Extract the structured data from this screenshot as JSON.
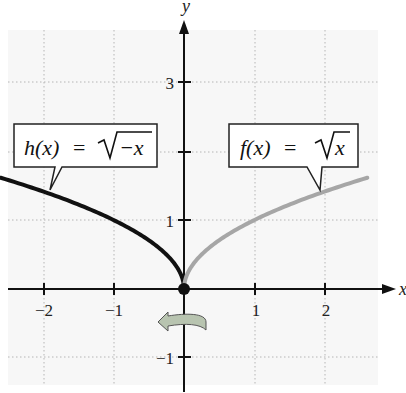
{
  "chart_data": {
    "type": "line",
    "title": "",
    "xlabel": "x",
    "ylabel": "y",
    "xlim": [
      -2.6,
      2.6
    ],
    "ylim": [
      -1.3,
      3.7
    ],
    "grid": true,
    "x_ticks": [
      -2,
      -1,
      1,
      2
    ],
    "x_tick_labels": [
      "−2",
      "−1",
      "1",
      "2"
    ],
    "y_ticks": [
      -1,
      1,
      2,
      3
    ],
    "y_tick_labels": [
      "−1",
      "1",
      "",
      "3"
    ],
    "series": [
      {
        "name": "h(x) = √(−x)",
        "color": "#111111",
        "x": [
          -2.6,
          -2,
          -1,
          -0.5,
          -0.25,
          0
        ],
        "values": [
          1.61,
          1.41,
          1.0,
          0.71,
          0.5,
          0
        ]
      },
      {
        "name": "f(x) = √x",
        "color": "#a6a6a6",
        "x": [
          0,
          0.25,
          0.5,
          1,
          2,
          2.6
        ],
        "values": [
          0,
          0.5,
          0.71,
          1.0,
          1.41,
          1.61
        ]
      }
    ],
    "annotations": [
      {
        "text_fn": "h(x)",
        "text_eq": "=",
        "text_rad": "−x",
        "points_to_x": -2
      },
      {
        "text_fn": "f(x)",
        "text_eq": "=",
        "text_rad": "x",
        "points_to_x": 2
      },
      {
        "type": "reflection-arrow",
        "direction": "left",
        "description": "reflection in the y-axis"
      }
    ],
    "origin_point": [
      0,
      0
    ]
  },
  "labels": {
    "x_axis": "x",
    "y_axis": "y",
    "h_fn": "h(x)",
    "h_eq": "=",
    "h_rad": "−x",
    "f_fn": "f(x)",
    "f_eq": "=",
    "f_rad": "x",
    "tick_x_m2": "−2",
    "tick_x_m1": "−1",
    "tick_x_1": "1",
    "tick_x_2": "2",
    "tick_y_3": "3",
    "tick_y_1": "1",
    "tick_y_m1": "−1"
  }
}
